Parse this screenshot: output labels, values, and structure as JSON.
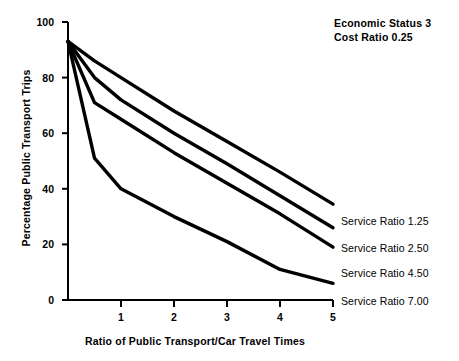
{
  "chart_data": {
    "type": "line",
    "title": "",
    "xlabel": "Ratio of Public Transport/Car Travel Times",
    "ylabel": "Percentage Public Transport Trips",
    "xlim": [
      0,
      5
    ],
    "ylim": [
      0,
      100
    ],
    "xticks": [
      "1",
      "2",
      "3",
      "4",
      "5"
    ],
    "xtick_values": [
      1,
      2,
      3,
      4,
      5
    ],
    "yticks": [
      "0",
      "20",
      "40",
      "60",
      "80",
      "100"
    ],
    "ytick_values": [
      0,
      20,
      40,
      60,
      80,
      100
    ],
    "grid": false,
    "legend_position": "right-of-axes-inline",
    "annotations": [
      "Economic Status 3",
      "Cost Ratio 0.25"
    ],
    "series": [
      {
        "name": "Service Ratio 1.25",
        "label": "Service Ratio 1.25",
        "x": [
          0,
          0.5,
          1,
          2,
          3,
          4,
          5
        ],
        "values": [
          93,
          86,
          80,
          68,
          57,
          46,
          34.5
        ]
      },
      {
        "name": "Service Ratio 2.50",
        "label": "Service Ratio 2.50",
        "x": [
          0,
          0.5,
          1,
          2,
          3,
          4,
          5
        ],
        "values": [
          93,
          80,
          72,
          60,
          49,
          37.5,
          26
        ]
      },
      {
        "name": "Service Ratio 4.50",
        "label": "Service Ratio 4.50",
        "x": [
          0,
          0.5,
          1,
          2,
          3,
          4,
          5
        ],
        "values": [
          93,
          71,
          65,
          53,
          42,
          31,
          19
        ]
      },
      {
        "name": "Service Ratio 7.00",
        "label": "Service Ratio 7.00",
        "x": [
          0,
          0.5,
          1,
          2,
          3,
          4,
          5
        ],
        "values": [
          93,
          51,
          40,
          30,
          21,
          11,
          6
        ]
      }
    ]
  },
  "axes": {
    "line_color": "#000000",
    "series_color": "#000000"
  }
}
